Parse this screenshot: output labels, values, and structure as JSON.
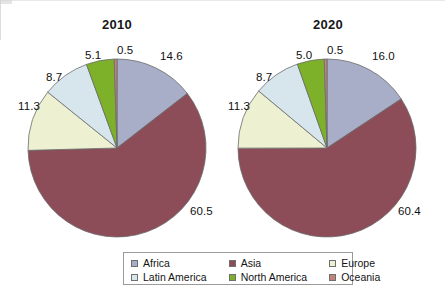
{
  "figure": {
    "background_color": "#ffffff",
    "border_color": "#9a9a9a"
  },
  "chart_data": [
    {
      "type": "pie",
      "title": "2010",
      "categories": [
        "Africa",
        "Asia",
        "Europe",
        "Latin America",
        "North America",
        "Oceania"
      ],
      "values": [
        14.6,
        60.5,
        11.3,
        8.7,
        5.1,
        0.5
      ],
      "labels": [
        "14.6",
        "60.5",
        "11.3",
        "8.7",
        "5.1",
        "0.5"
      ],
      "colors": [
        "#a8aec8",
        "#8c4d58",
        "#eef0d2",
        "#d7e6ec",
        "#7eb12a",
        "#c1847a"
      ],
      "start_angle_deg": 0,
      "direction": "clockwise",
      "units": "percent",
      "legend_position": "bottom"
    },
    {
      "type": "pie",
      "title": "2020",
      "categories": [
        "Africa",
        "Asia",
        "Europe",
        "Latin America",
        "North America",
        "Oceania"
      ],
      "values": [
        16.0,
        60.4,
        11.3,
        8.7,
        5.0,
        0.5
      ],
      "labels": [
        "16.0",
        "60.4",
        "11.3",
        "8.7",
        "5.0",
        "0.5"
      ],
      "colors": [
        "#a8aec8",
        "#8c4d58",
        "#eef0d2",
        "#d7e6ec",
        "#7eb12a",
        "#c1847a"
      ],
      "start_angle_deg": 0,
      "direction": "clockwise",
      "units": "percent",
      "legend_position": "bottom"
    }
  ],
  "legend": {
    "items": [
      {
        "label": "Africa",
        "color": "#a8aec8"
      },
      {
        "label": "Asia",
        "color": "#8c4d58"
      },
      {
        "label": "Europe",
        "color": "#eef0d2"
      },
      {
        "label": "Latin America",
        "color": "#d7e6ec"
      },
      {
        "label": "North America",
        "color": "#7eb12a"
      },
      {
        "label": "Oceania",
        "color": "#c1847a"
      }
    ]
  },
  "bleed_through_text": {
    "left": [
      "is a form",
      "ame along",
      "sire.",
      "of change occurs when",
      "A man or woman will",
      "political candidate"
    ],
    "right": [
      "y, service",
      "may be in the eye of the",
      "ellect a spare that is both",
      "e cartridge. An eye ca",
      "n. It may be tru"
    ]
  }
}
